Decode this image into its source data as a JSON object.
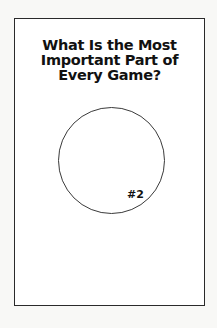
{
  "card": {
    "title_lines": [
      "What Is the Most",
      "Important Part of",
      "Every Game?"
    ],
    "circle_label": "#2"
  }
}
